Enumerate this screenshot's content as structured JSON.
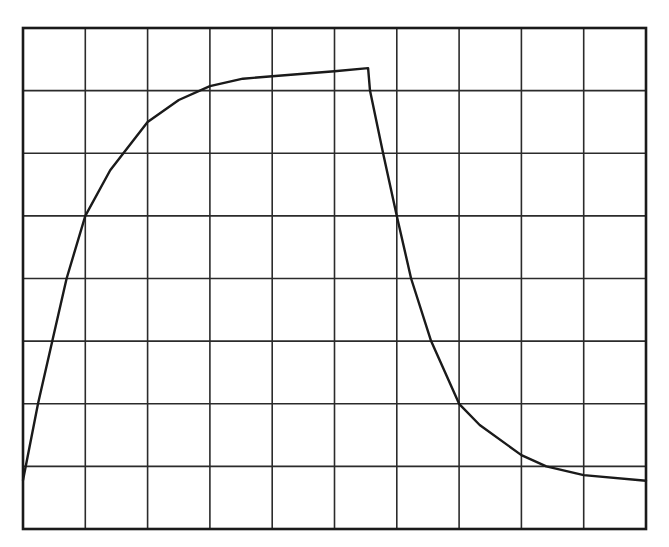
{
  "chart_data": {
    "type": "line",
    "title": "",
    "xlabel": "",
    "ylabel": "",
    "xlim": [
      0,
      10
    ],
    "ylim": [
      0,
      8
    ],
    "grid": true,
    "grid_divisions": {
      "x": 10,
      "y": 8
    },
    "legend": null,
    "tick_labels": {
      "x": [],
      "y": []
    },
    "series": [
      {
        "name": "curve",
        "color": "#1a1a1a",
        "x": [
          0,
          0.24,
          0.47,
          0.7,
          1.0,
          1.4,
          2.0,
          2.5,
          3.0,
          3.53,
          4.0,
          5.0,
          5.54,
          5.57,
          5.78,
          6.0,
          6.23,
          6.55,
          7.0,
          7.33,
          8.0,
          8.4,
          9.0,
          10.0
        ],
        "y": [
          0.78,
          2.0,
          3.0,
          4.0,
          5.0,
          5.73,
          6.5,
          6.85,
          7.07,
          7.19,
          7.23,
          7.31,
          7.36,
          7.0,
          6.0,
          5.0,
          4.0,
          3.0,
          2.0,
          1.66,
          1.18,
          1.0,
          0.86,
          0.77
        ]
      }
    ],
    "annotations": []
  },
  "layout": {
    "plot_box": {
      "left": 23,
      "top": 28,
      "right": 646,
      "bottom": 529
    },
    "colors": {
      "background": "#ffffff",
      "grid": "#2b2b2b",
      "line": "#1a1a1a"
    }
  }
}
